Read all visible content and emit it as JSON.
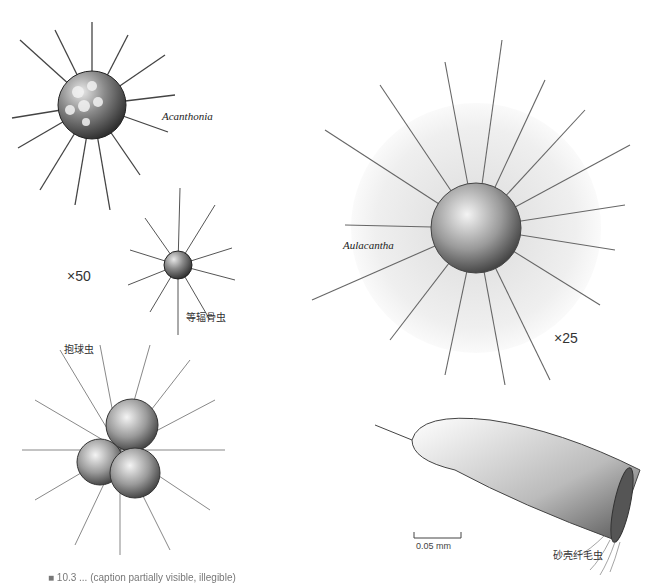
{
  "figure": {
    "panels": [
      {
        "id": "acanthonia",
        "label": "Acanthonia",
        "magnification": "×50"
      },
      {
        "id": "isospora",
        "label": "等辐骨虫"
      },
      {
        "id": "aulacantha",
        "label": "Aulacantha",
        "magnification": "×25"
      },
      {
        "id": "orbulina",
        "label": "抱球虫"
      },
      {
        "id": "tintinnid",
        "label": "砂壳纤毛虫",
        "scale_bar": "0.05 mm"
      }
    ],
    "caption": "■ 10.3 ... (caption partially visible, illegible)"
  }
}
